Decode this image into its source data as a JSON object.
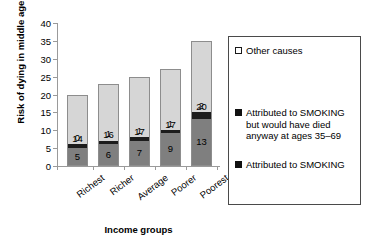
{
  "chart_data": {
    "type": "bar",
    "stacked": true,
    "title": "",
    "xlabel": "Income groups",
    "ylabel": "Risk of dying in middle age (%)",
    "categories": [
      "Richest",
      "Richer",
      "Average",
      "Poorer",
      "Poorest"
    ],
    "ylim": [
      0,
      40
    ],
    "yticks": [
      0,
      5,
      10,
      15,
      20,
      25,
      30,
      35,
      40
    ],
    "grid": false,
    "legend_position": "right",
    "series": [
      {
        "name": "Attributed to SMOKING",
        "key": "smoking",
        "color": "#7f7f7f",
        "values": [
          5,
          6,
          7,
          9,
          13
        ]
      },
      {
        "name": "Attributed to SMOKING but would have died anyway at ages 35-69",
        "key": "anyway",
        "color": "#1c1c1c",
        "values": [
          0,
          1,
          1,
          1,
          2
        ]
      },
      {
        "name": "Other causes",
        "key": "other",
        "color": "#d6d6d6",
        "values": [
          14,
          16,
          17,
          17,
          20
        ]
      }
    ],
    "totals": [
      20,
      23,
      25,
      27,
      35
    ]
  },
  "axes": {
    "y_title": "Risk of dying in middle age (%)",
    "x_title": "Income groups",
    "y_tick_labels": [
      "40",
      "35",
      "30",
      "25",
      "20",
      "15",
      "10",
      "5",
      "0"
    ],
    "x_tick_labels": [
      "Richest",
      "Richer",
      "Average",
      "Poorer",
      "Poorest"
    ]
  },
  "bars": [
    {
      "category": "Richest",
      "other": "14",
      "anyway": "0",
      "smoking": "5"
    },
    {
      "category": "Richer",
      "other": "16",
      "anyway": "1",
      "smoking": "6"
    },
    {
      "category": "Average",
      "other": "17",
      "anyway": "1",
      "smoking": "7"
    },
    {
      "category": "Poorer",
      "other": "17",
      "anyway": "1",
      "smoking": "9"
    },
    {
      "category": "Poorest",
      "other": "20",
      "anyway": "2",
      "smoking": "13"
    }
  ],
  "legend": {
    "items": [
      {
        "swatch": "other",
        "label": "Other causes"
      },
      {
        "swatch": "anyway",
        "label": "Attributed to SMOKING but would have died anyway at ages 35–69"
      },
      {
        "swatch": "smoking",
        "label": "Attributed to SMOKING"
      }
    ]
  }
}
